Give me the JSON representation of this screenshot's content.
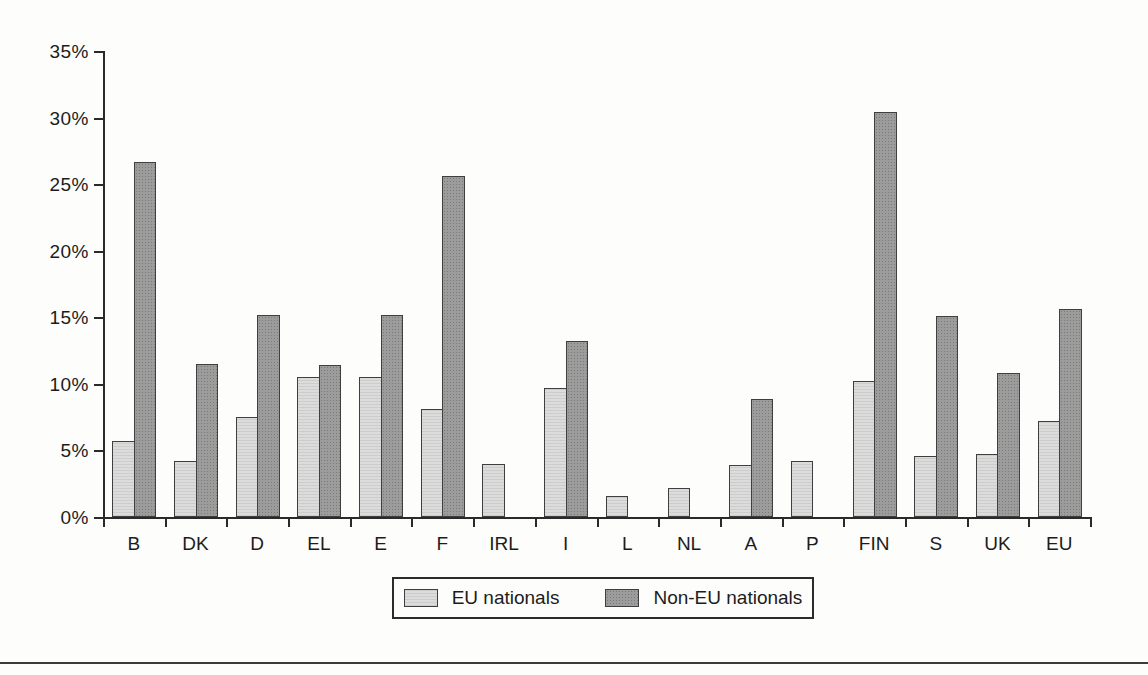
{
  "chart_data": {
    "type": "bar",
    "title": "",
    "xlabel": "",
    "ylabel": "",
    "categories": [
      "B",
      "DK",
      "D",
      "EL",
      "E",
      "F",
      "IRL",
      "I",
      "L",
      "NL",
      "A",
      "P",
      "FIN",
      "S",
      "UK",
      "EU"
    ],
    "series": [
      {
        "name": "EU nationals",
        "color": "#dcdcdc",
        "values": [
          5.7,
          4.2,
          7.5,
          10.5,
          10.5,
          8.1,
          4.0,
          9.7,
          1.6,
          2.2,
          3.9,
          4.2,
          10.2,
          4.6,
          4.7,
          7.2
        ]
      },
      {
        "name": "Non-EU nationals",
        "color": "#9c9c9c",
        "values": [
          26.7,
          11.5,
          15.2,
          11.4,
          15.2,
          25.6,
          null,
          13.2,
          null,
          null,
          8.9,
          null,
          30.4,
          15.1,
          10.8,
          15.6
        ]
      }
    ],
    "ylim": [
      0,
      35
    ],
    "ytick_step": 5,
    "ytick_labels": [
      "0%",
      "5%",
      "10%",
      "15%",
      "20%",
      "25%",
      "30%",
      "35%"
    ],
    "grid": false,
    "legend_position": "bottom"
  },
  "legend": {
    "eu_label": "EU nationals",
    "non_eu_label": "Non-EU nationals"
  },
  "colors": {
    "eu_bar": "#dcdcdc",
    "non_eu_bar": "#9c9c9c",
    "axis": "#2a2a2a",
    "background": "#fdfdfb"
  }
}
